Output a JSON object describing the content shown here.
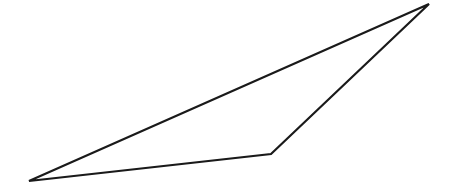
{
  "canvas": {
    "width": 452,
    "height": 194,
    "background": "#ffffff"
  },
  "diagram": {
    "shape": "triangle",
    "stroke_color": "#1a1a1a",
    "stroke_width": 2.2,
    "fill": "none",
    "vertices": [
      {
        "name": "top-right",
        "x": 429,
        "y": 4
      },
      {
        "name": "bottom-left",
        "x": 29,
        "y": 181
      },
      {
        "name": "bottom-middle",
        "x": 271,
        "y": 154
      }
    ]
  }
}
